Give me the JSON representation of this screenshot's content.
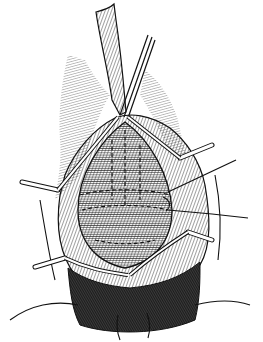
{
  "figure": {
    "type": "surgical line illustration",
    "style": "black ink engraving on white",
    "colors": {
      "background": "#ffffff",
      "ink": "#111111",
      "dark_fill": "#2a2a2a",
      "mid_fill": "#9a9a9a"
    },
    "elements": [
      "catheter-tube",
      "retractor-instrument",
      "suture-retractor-left-upper",
      "suture-retractor-left-lower",
      "suture-retractor-right-upper",
      "suture-retractor-right-lower",
      "right-suture-needle",
      "oval-tissue-field",
      "dashed-suture-lines",
      "dark-hatched-lower-region",
      "hair-hatching-left",
      "hair-hatching-right",
      "thigh-contour-lines"
    ]
  }
}
